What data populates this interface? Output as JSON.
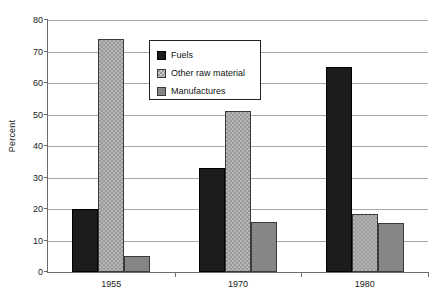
{
  "chart_data": {
    "type": "bar",
    "title": "",
    "xlabel": "",
    "ylabel": "Percent",
    "categories": [
      "1955",
      "1970",
      "1980"
    ],
    "series": [
      {
        "name": "Fuels",
        "values": [
          20,
          33,
          65
        ],
        "color": "#1c1c1c",
        "fill": "solid-black"
      },
      {
        "name": "Other raw material",
        "values": [
          74,
          51,
          18.5
        ],
        "color": "#9a9a9a",
        "fill": "checkered-light-gray"
      },
      {
        "name": "Manufactures",
        "values": [
          5,
          16,
          15.5
        ],
        "color": "#868686",
        "fill": "solid-gray"
      }
    ],
    "ylim": [
      0,
      80
    ],
    "yticks": [
      0,
      10,
      20,
      30,
      40,
      50,
      60,
      70,
      80
    ],
    "ytick_labels": [
      "0",
      "10",
      "20",
      "30",
      "40",
      "50",
      "60",
      "70",
      "80"
    ],
    "grid": true,
    "grid_axis": "y",
    "legend_position": "upper-center-left",
    "background": "#ffffff",
    "grid_color": "#a8a8a8",
    "axis_color": "#6b6b6b"
  },
  "axis": {
    "y_title": "Percent"
  },
  "legend": {
    "items": [
      {
        "label": "Fuels"
      },
      {
        "label": "Other raw material"
      },
      {
        "label": "Manufactures"
      }
    ]
  }
}
